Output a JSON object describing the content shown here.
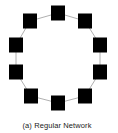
{
  "figure": {
    "caption": "(a) Regular Network",
    "type": "ring lattice",
    "node_color": "#000000",
    "edge_color": "#b0b0b0",
    "node_size": 14,
    "nodes": [
      {
        "id": 0,
        "x": 58,
        "y": 13
      },
      {
        "id": 1,
        "x": 85,
        "y": 21
      },
      {
        "id": 2,
        "x": 100,
        "y": 45
      },
      {
        "id": 3,
        "x": 100,
        "y": 72
      },
      {
        "id": 4,
        "x": 85,
        "y": 96
      },
      {
        "id": 5,
        "x": 58,
        "y": 103
      },
      {
        "id": 6,
        "x": 31,
        "y": 96
      },
      {
        "id": 7,
        "x": 16,
        "y": 72
      },
      {
        "id": 8,
        "x": 16,
        "y": 45
      },
      {
        "id": 9,
        "x": 30,
        "y": 21
      }
    ],
    "edges": [
      [
        0,
        1
      ],
      [
        1,
        2
      ],
      [
        2,
        3
      ],
      [
        3,
        4
      ],
      [
        4,
        5
      ],
      [
        5,
        6
      ],
      [
        6,
        7
      ],
      [
        7,
        8
      ],
      [
        8,
        9
      ],
      [
        9,
        0
      ]
    ]
  }
}
